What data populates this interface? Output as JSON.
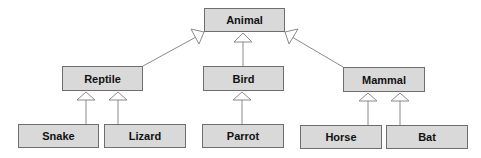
{
  "diagram": {
    "type": "uml-class-inheritance",
    "nodes": [
      {
        "id": "animal",
        "label": "Animal",
        "x": 204,
        "y": 8,
        "w": 81,
        "h": 24
      },
      {
        "id": "reptile",
        "label": "Reptile",
        "x": 62,
        "y": 66,
        "w": 81,
        "h": 25
      },
      {
        "id": "bird",
        "label": "Bird",
        "x": 203,
        "y": 66,
        "w": 81,
        "h": 25
      },
      {
        "id": "mammal",
        "label": "Mammal",
        "x": 343,
        "y": 67,
        "w": 82,
        "h": 25
      },
      {
        "id": "snake",
        "label": "Snake",
        "x": 18,
        "y": 124,
        "w": 81,
        "h": 24
      },
      {
        "id": "lizard",
        "label": "Lizard",
        "x": 104,
        "y": 124,
        "w": 82,
        "h": 24
      },
      {
        "id": "parrot",
        "label": "Parrot",
        "x": 202,
        "y": 124,
        "w": 82,
        "h": 24
      },
      {
        "id": "horse",
        "label": "Horse",
        "x": 300,
        "y": 125,
        "w": 82,
        "h": 24
      },
      {
        "id": "bat",
        "label": "Bat",
        "x": 386,
        "y": 125,
        "w": 82,
        "h": 24
      }
    ],
    "edges": [
      {
        "from": "reptile",
        "to": "animal"
      },
      {
        "from": "bird",
        "to": "animal"
      },
      {
        "from": "mammal",
        "to": "animal"
      },
      {
        "from": "snake",
        "to": "reptile"
      },
      {
        "from": "lizard",
        "to": "reptile"
      },
      {
        "from": "parrot",
        "to": "bird"
      },
      {
        "from": "horse",
        "to": "mammal"
      },
      {
        "from": "bat",
        "to": "mammal"
      }
    ]
  }
}
